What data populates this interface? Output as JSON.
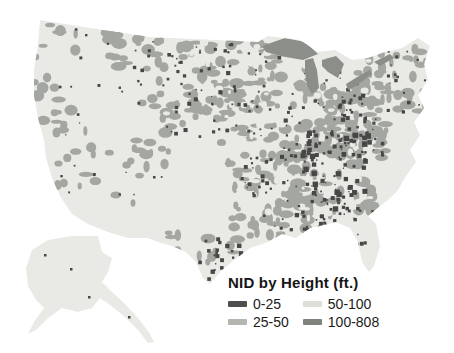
{
  "legend": {
    "title": "NID by Height (ft.)",
    "items": [
      {
        "label": "0-25",
        "color": "#4f504d"
      },
      {
        "label": "25-50",
        "color": "#b3b6b0"
      },
      {
        "label": "50-100",
        "color": "#dcded8"
      },
      {
        "label": "100-808",
        "color": "#7f827d"
      }
    ]
  },
  "map": {
    "description": "United States (contiguous + Alaska) dot-density map of National Inventory of Dams by height",
    "colors": {
      "background": "#ffffff",
      "land": "#e9eae5",
      "medium": "#a4a7a1",
      "dark": "#474845",
      "lakes": "#8b8e89",
      "hole": "#e9eae5"
    }
  }
}
